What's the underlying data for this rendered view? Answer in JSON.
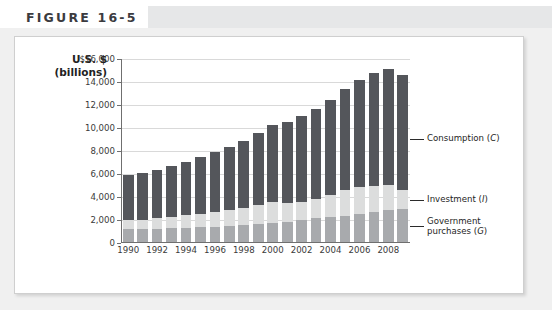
{
  "figure": {
    "title": "FIGURE 16-5"
  },
  "axis_title": {
    "line1": "U.S. $",
    "line2": "(billions)"
  },
  "callouts": [
    {
      "name": "consumption",
      "text": "Consumption (C)",
      "label": "Consumption",
      "symbol": "C"
    },
    {
      "name": "investment",
      "text": "Investment (I)",
      "label": "Investment",
      "symbol": "I"
    },
    {
      "name": "government-purchases",
      "text": "Government\npurchases (G)",
      "label": "Government purchases",
      "symbol": "G"
    }
  ],
  "colors": {
    "consumption": "#54565b",
    "investment": "#dcdddd",
    "government": "#a8aaad",
    "gridline": "#d9d9d9",
    "axis": "#6f6f6f",
    "header_band": "#e6e7e8",
    "mat": "#f0f0f0"
  },
  "chart_data": {
    "type": "bar",
    "subtype": "stacked",
    "title": "FIGURE 16-5",
    "xlabel": "",
    "ylabel": "U.S. $ (billions)",
    "ylim": [
      0,
      16000
    ],
    "ytick_labels": [
      "$16,000",
      "14,000",
      "12,000",
      "10,000",
      "8,000",
      "6,000",
      "4,000",
      "2,000",
      "0"
    ],
    "ytick_values": [
      16000,
      14000,
      12000,
      10000,
      8000,
      6000,
      4000,
      2000,
      0
    ],
    "grid": true,
    "legend": "annotated-callouts",
    "categories": [
      1990,
      1991,
      1992,
      1993,
      1994,
      1995,
      1996,
      1997,
      1998,
      1999,
      2000,
      2001,
      2002,
      2003,
      2004,
      2005,
      2006,
      2007,
      2008,
      2009
    ],
    "xtick_labels": [
      "1990",
      "1992",
      "1994",
      "1996",
      "1998",
      "2000",
      "2002",
      "2004",
      "2006",
      "2008"
    ],
    "series": [
      {
        "name": "Government purchases (G)",
        "symbol": "G",
        "color": "#a8aaad",
        "values": [
          1180,
          1200,
          1250,
          1290,
          1330,
          1380,
          1420,
          1480,
          1550,
          1650,
          1740,
          1850,
          2000,
          2160,
          2290,
          2370,
          2510,
          2670,
          2880,
          2930
        ]
      },
      {
        "name": "Investment (I)",
        "symbol": "I",
        "color": "#dcdddd",
        "values": [
          860,
          840,
          910,
          1010,
          1100,
          1130,
          1270,
          1390,
          1520,
          1630,
          1790,
          1590,
          1580,
          1680,
          1900,
          2240,
          2330,
          2280,
          2180,
          1660
        ]
      },
      {
        "name": "Consumption (C)",
        "symbol": "C",
        "color": "#54565b",
        "values": [
          3900,
          4010,
          4190,
          4410,
          4650,
          4950,
          5250,
          5520,
          5840,
          6250,
          6770,
          7060,
          7480,
          7810,
          8290,
          8760,
          9310,
          9830,
          10040,
          10020
        ]
      }
    ],
    "totals": [
      5940,
      6050,
      6350,
      6710,
      7080,
      7460,
      7940,
      8390,
      8910,
      9530,
      10300,
      10500,
      11060,
      11650,
      12480,
      13370,
      14150,
      14780,
      15100,
      14610
    ]
  }
}
